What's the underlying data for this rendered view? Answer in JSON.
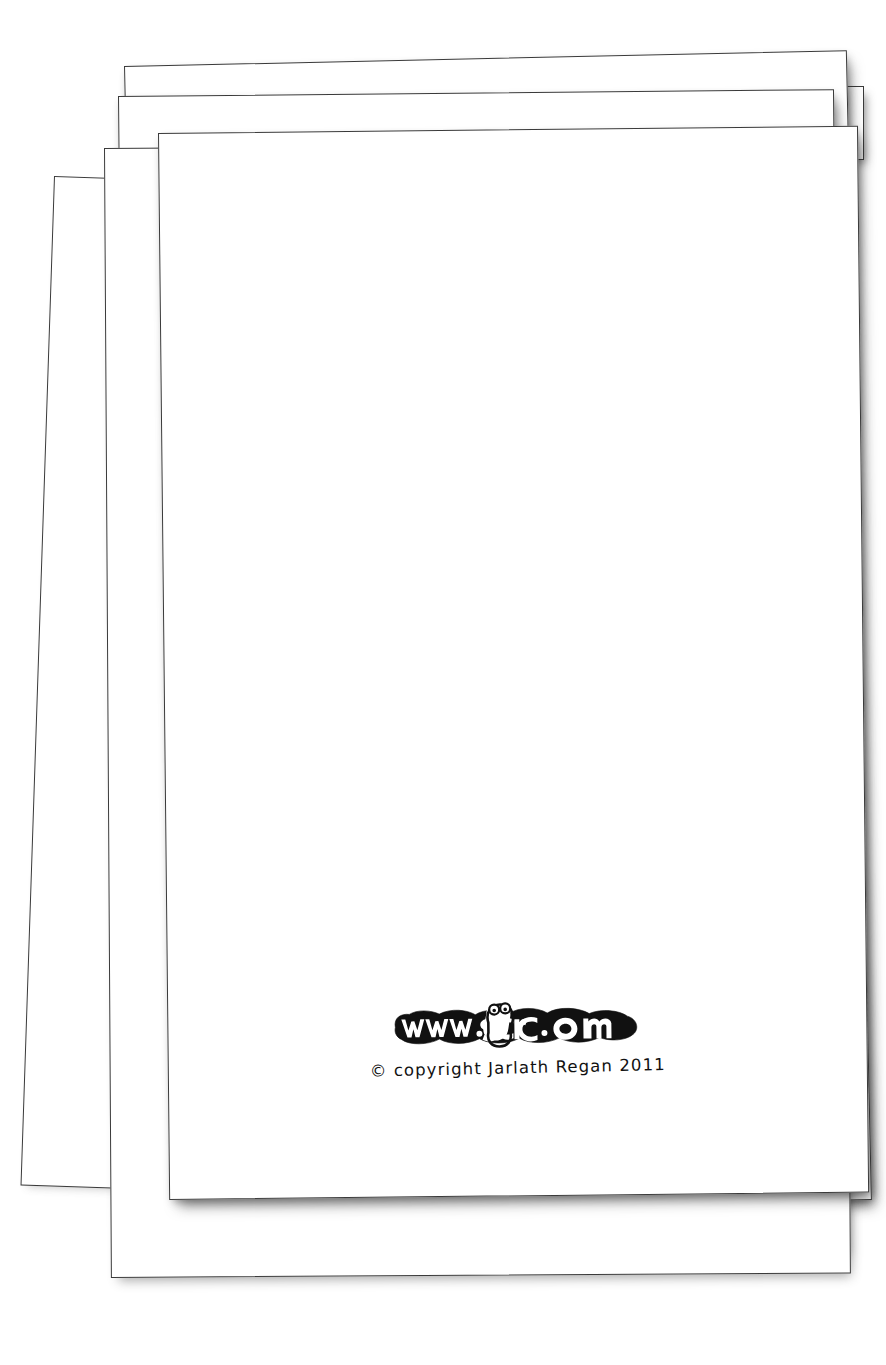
{
  "document": {
    "kind": "scanned-paper-stack",
    "sheet_count": 7,
    "background_color": "#ffffff",
    "ink_color": "#3a3a3a"
  },
  "front_sheet": {
    "name": "front-sheet",
    "body_text": "",
    "logo": {
      "icon_name": "jigscr-logo",
      "text": "www.jigscr.com",
      "style": "hand-drawn-outline-cartoon",
      "color": "#111111"
    },
    "copyright": {
      "symbol": "©",
      "text": "© copyright Jarlath Regan 2011",
      "word": "copyright",
      "author": "Jarlath Regan",
      "year": "2011"
    }
  },
  "stack": {
    "layers": [
      {
        "label": "sheet-7-backmost-strip-a"
      },
      {
        "label": "sheet-6-backmost-strip-b"
      },
      {
        "label": "sheet-5-top-back"
      },
      {
        "label": "sheet-4-upper"
      },
      {
        "label": "sheet-3-tilted-left"
      },
      {
        "label": "sheet-2-middle"
      },
      {
        "label": "sheet-1-front"
      }
    ]
  }
}
